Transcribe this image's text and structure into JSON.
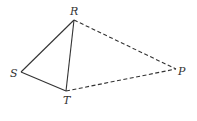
{
  "diagram": {
    "type": "geometry-figure",
    "points": [
      {
        "id": "R",
        "label": "R"
      },
      {
        "id": "S",
        "label": "S"
      },
      {
        "id": "T",
        "label": "T"
      },
      {
        "id": "P",
        "label": "P"
      }
    ],
    "segments": [
      {
        "from": "R",
        "to": "S",
        "style": "solid"
      },
      {
        "from": "S",
        "to": "T",
        "style": "solid"
      },
      {
        "from": "R",
        "to": "T",
        "style": "solid"
      },
      {
        "from": "R",
        "to": "P",
        "style": "dashed"
      },
      {
        "from": "T",
        "to": "P",
        "style": "dashed"
      }
    ],
    "line_color": "#333333"
  }
}
